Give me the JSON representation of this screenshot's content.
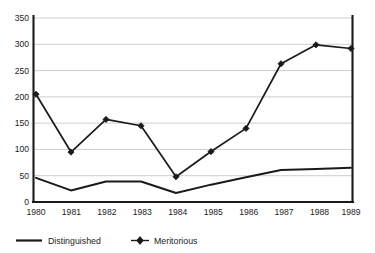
{
  "chart_data": {
    "type": "line",
    "title": "",
    "subtitle": "",
    "xlabel": "",
    "ylabel": "",
    "categories": [
      "1980",
      "1981",
      "1982",
      "1983",
      "1984",
      "1985",
      "1986",
      "1987",
      "1988",
      "1989"
    ],
    "series": [
      {
        "name": "Distinguished",
        "marker": "none",
        "values": [
          46,
          22,
          39,
          39,
          17,
          33,
          47,
          61,
          63,
          65
        ]
      },
      {
        "name": "Meritorious",
        "marker": "diamond",
        "values": [
          205,
          95,
          157,
          145,
          48,
          96,
          140,
          263,
          299,
          292
        ]
      }
    ],
    "ylim": [
      0,
      350
    ],
    "yticks": [
      0,
      50,
      100,
      150,
      200,
      250,
      300,
      350
    ],
    "ytick_labels": [
      "0",
      "50",
      "100",
      "150",
      "200",
      "250",
      "300",
      "350"
    ],
    "xtick_labels": [
      "1980",
      "1981",
      "1982",
      "1983",
      "1984",
      "1985",
      "1986",
      "1987",
      "1988",
      "1989"
    ],
    "grid": "horizontal",
    "legend_position": "bottom",
    "colors": {
      "line": "#1a1a1a",
      "grid": "#b9b9b9",
      "axis": "#1a1a1a",
      "background": "#ffffff"
    }
  },
  "legend": {
    "items": [
      {
        "label": "Distinguished",
        "marker": "none"
      },
      {
        "label": "Meritorious",
        "marker": "diamond"
      }
    ]
  },
  "axes": {
    "y": {
      "labels": [
        "350",
        "300",
        "250",
        "200",
        "150",
        "100",
        "50",
        "0"
      ]
    },
    "x": {
      "labels": [
        "1980",
        "1981",
        "1982",
        "1983",
        "1984",
        "1985",
        "1986",
        "1987",
        "1988",
        "1989"
      ]
    }
  }
}
